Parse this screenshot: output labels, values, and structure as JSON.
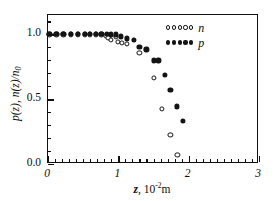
{
  "chart_data": {
    "type": "scatter",
    "title": "",
    "xlabel": "z, 10-2 m",
    "xlabel_parts": {
      "symbol": "z",
      "comma": ", 10",
      "exponent": "-2",
      "unit": "m"
    },
    "ylabel": "p(z), n(z)/n0",
    "ylabel_parts": {
      "p": "p",
      "pz": "(z)",
      "sep": ", ",
      "n": "n",
      "nz": "(z)/",
      "n0": "n",
      "sub0": "0"
    },
    "xlim": [
      0,
      3
    ],
    "ylim": [
      0.0,
      1.15
    ],
    "grid": false,
    "legend_position": "top-right",
    "x_ticks": [
      {
        "value": 0,
        "label": "0"
      },
      {
        "value": 1,
        "label": "1"
      },
      {
        "value": 2,
        "label": "2"
      },
      {
        "value": 3,
        "label": "3"
      }
    ],
    "x_minor_count_per_interval": 9,
    "y_ticks": [
      {
        "value": 0.0,
        "label": "0.0"
      },
      {
        "value": 0.5,
        "label": "0.5"
      },
      {
        "value": 1.0,
        "label": "1.0"
      }
    ],
    "y_minor_values": [
      0.1,
      0.2,
      0.3,
      0.4,
      0.6,
      0.7,
      0.8,
      0.9,
      1.1
    ],
    "series": [
      {
        "name": "n",
        "marker": "open-circle",
        "points": [
          [
            0.02,
            1.0
          ],
          [
            0.12,
            1.0
          ],
          [
            0.22,
            1.0
          ],
          [
            0.32,
            1.0
          ],
          [
            0.42,
            1.0
          ],
          [
            0.52,
            1.0
          ],
          [
            0.6,
            1.0
          ],
          [
            0.68,
            1.0
          ],
          [
            0.76,
            1.0
          ],
          [
            0.82,
            0.99
          ],
          [
            0.86,
            0.975
          ],
          [
            0.9,
            0.955
          ],
          [
            0.97,
            0.985
          ],
          [
            0.99,
            0.945
          ],
          [
            1.05,
            0.935
          ],
          [
            1.12,
            0.93
          ],
          [
            1.3,
            0.855
          ],
          [
            1.5,
            0.665
          ],
          [
            1.62,
            0.425
          ],
          [
            1.74,
            0.225
          ],
          [
            1.84,
            0.07
          ]
        ]
      },
      {
        "name": "p",
        "marker": "filled-circle",
        "points": [
          [
            0.02,
            1.005
          ],
          [
            0.12,
            1.005
          ],
          [
            0.22,
            1.005
          ],
          [
            0.32,
            1.005
          ],
          [
            0.42,
            1.005
          ],
          [
            0.52,
            1.005
          ],
          [
            0.6,
            1.005
          ],
          [
            0.68,
            1.005
          ],
          [
            0.76,
            1.005
          ],
          [
            0.84,
            1.005
          ],
          [
            0.9,
            1.0
          ],
          [
            0.96,
            1.0
          ],
          [
            1.04,
            0.985
          ],
          [
            1.12,
            0.97
          ],
          [
            1.22,
            0.955
          ],
          [
            1.3,
            0.905
          ],
          [
            1.4,
            0.885
          ],
          [
            1.5,
            0.8
          ],
          [
            1.57,
            0.8
          ],
          [
            1.66,
            0.685
          ],
          [
            1.74,
            0.575
          ],
          [
            1.83,
            0.445
          ],
          [
            1.92,
            0.33
          ]
        ]
      }
    ],
    "legend": [
      {
        "label": "n",
        "marker": "open-circle",
        "swatch_count": 5
      },
      {
        "label": "p",
        "marker": "filled-circle",
        "swatch_count": 5
      }
    ]
  }
}
